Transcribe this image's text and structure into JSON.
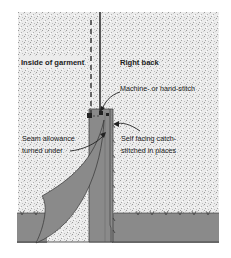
{
  "diagram": {
    "labels": {
      "inside_garment": "Inside of garment",
      "right_back": "Right back",
      "stitch": "Machine- or hand-stitch",
      "seam_line1": "Seam allowance",
      "seam_line2": "turned under",
      "facing_line1": "Self facing catch-",
      "facing_line2": "stitched in places"
    },
    "colors": {
      "fabric": "#8a8a8a",
      "background_speckle": "#e6e6e6",
      "line": "#222222"
    }
  }
}
